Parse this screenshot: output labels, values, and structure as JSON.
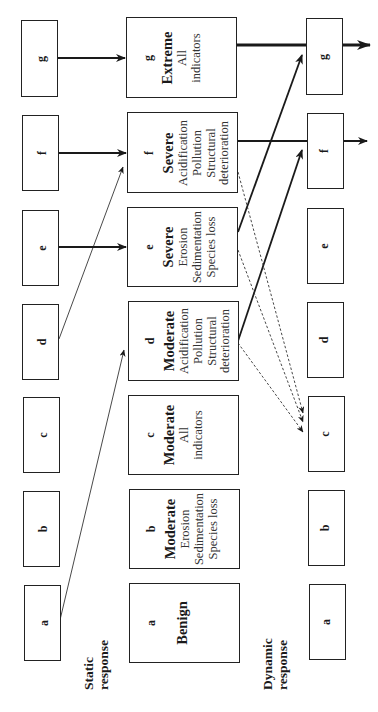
{
  "diagram": {
    "orientation": "rotated -90deg (text reads bottom-to-top)",
    "labels": {
      "static": [
        "Static",
        "response"
      ],
      "dynamic": [
        "Dynamic",
        "response"
      ]
    },
    "left_boxes": [
      {
        "id": "g",
        "label": "g"
      },
      {
        "id": "f",
        "label": "f"
      },
      {
        "id": "e",
        "label": "e"
      },
      {
        "id": "d",
        "label": "d"
      },
      {
        "id": "c",
        "label": "c"
      },
      {
        "id": "b",
        "label": "b"
      },
      {
        "id": "a",
        "label": "a"
      }
    ],
    "middle_boxes": [
      {
        "id": "g",
        "letter": "g",
        "level": "Extreme",
        "indicators": [
          "All",
          "indicators"
        ]
      },
      {
        "id": "f",
        "letter": "f",
        "level": "Severe",
        "indicators": [
          "Acidification",
          "Pollution",
          "Structural",
          "deterioration"
        ]
      },
      {
        "id": "e",
        "letter": "e",
        "level": "Severe",
        "indicators": [
          "Erosion",
          "Sedimentation",
          "Species loss"
        ]
      },
      {
        "id": "d",
        "letter": "d",
        "level": "Moderate",
        "indicators": [
          "Acidification",
          "Pollution",
          "Structural",
          "deterioration"
        ]
      },
      {
        "id": "c",
        "letter": "c",
        "level": "Moderate",
        "indicators": [
          "All",
          "indicators"
        ]
      },
      {
        "id": "b",
        "letter": "b",
        "level": "Moderate",
        "indicators": [
          "Erosion",
          "Sedimentation",
          "Species loss"
        ]
      },
      {
        "id": "a",
        "letter": "a",
        "level": "Benign",
        "indicators": []
      }
    ],
    "right_boxes": [
      {
        "id": "g",
        "label": "g"
      },
      {
        "id": "f",
        "label": "f"
      },
      {
        "id": "e",
        "label": "e"
      },
      {
        "id": "d",
        "label": "d"
      },
      {
        "id": "c",
        "label": "c"
      },
      {
        "id": "b",
        "label": "b"
      },
      {
        "id": "a",
        "label": "a"
      }
    ],
    "connections": [
      {
        "from": "left.g",
        "to": "middle.g",
        "style": "solid-medium"
      },
      {
        "from": "left.f",
        "to": "middle.f",
        "style": "solid-medium"
      },
      {
        "from": "left.e",
        "to": "middle.e",
        "style": "solid-medium"
      },
      {
        "from": "left.d",
        "to": "middle.f",
        "style": "thin"
      },
      {
        "from": "left.a",
        "to": "middle.d",
        "style": "thin"
      },
      {
        "from": "middle.g",
        "to": "beyond-right",
        "style": "solid-thick"
      },
      {
        "from": "middle.f",
        "to": "beyond-right",
        "style": "solid-medium"
      },
      {
        "from": "middle.e",
        "to": "right.g",
        "style": "solid-medium"
      },
      {
        "from": "middle.d",
        "to": "right.f",
        "style": "solid-medium"
      },
      {
        "from": "middle.f",
        "to": "right.c",
        "style": "dashed"
      },
      {
        "from": "middle.e",
        "to": "right.c",
        "style": "dashed"
      },
      {
        "from": "middle.d",
        "to": "right.c",
        "style": "dashed"
      }
    ]
  }
}
